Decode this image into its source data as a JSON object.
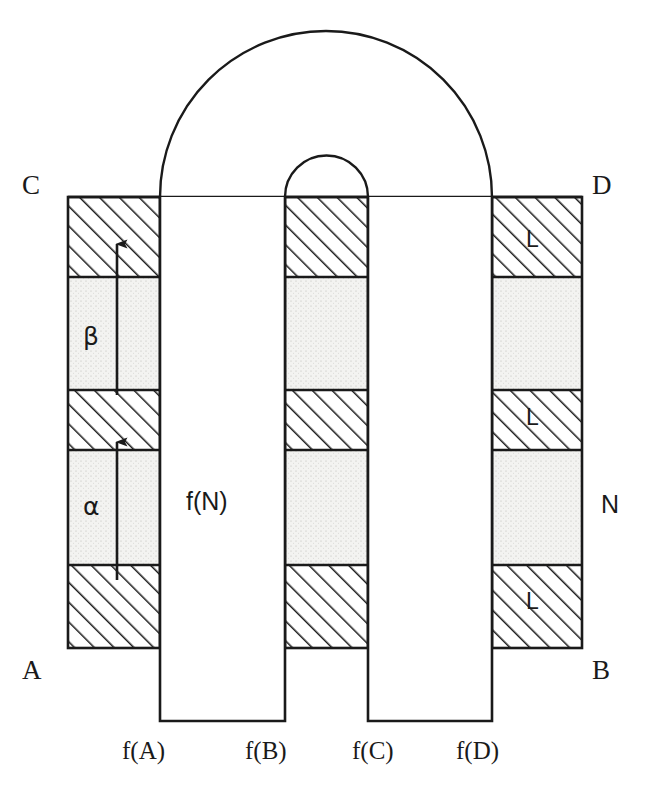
{
  "figure": {
    "background": "#ffffff",
    "stroke_color": "#1a1a1a",
    "hatch_color": "#1a1a1a",
    "dot_fill_color": "#f0f0ee"
  },
  "corner_labels": {
    "top_left": "C",
    "top_right": "D",
    "bottom_left": "A",
    "bottom_right": "B",
    "right_middle": "N"
  },
  "interval_labels": {
    "upper": "β",
    "lower": "α"
  },
  "column_label": "f(N)",
  "band_marks": {
    "right_top": "L",
    "right_middle": "L",
    "right_bottom": "L"
  },
  "bottom_labels": [
    {
      "id": "fa",
      "text": "f(A)"
    },
    {
      "id": "fb",
      "text": "f(B)"
    },
    {
      "id": "fc",
      "text": "f(C)"
    },
    {
      "id": "fd",
      "text": "f(D)"
    }
  ]
}
